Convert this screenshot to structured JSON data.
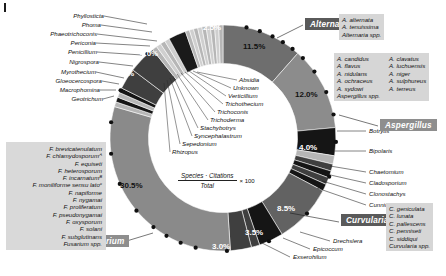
{
  "figure": {
    "corner_mark": "|",
    "formula_numerator": "Species · Citations",
    "formula_denominator": "Total",
    "formula_multiplier": "× 100"
  },
  "chart_data": {
    "type": "pie",
    "title": "",
    "subtitle": "",
    "xlabel": "",
    "ylabel": "",
    "legend_position": "callouts",
    "donut": true,
    "inner_radius_ratio": 0.66,
    "start_angle_deg": -90,
    "direction": "clockwise",
    "value_unit": "%",
    "categories": [
      "Alternaria",
      "Aspergillus",
      "Bipolaris",
      "Botrytis",
      "Chaetomium",
      "Cladosporium",
      "Clonostachys",
      "Cunninghamella",
      "Curvularia",
      "Drechslera",
      "Epicoccum",
      "Exserohilum",
      "Fusarium",
      "Geotrichum",
      "Macrophomina",
      "Gloeocercospora",
      "Myrothecium",
      "Nigrospora",
      "Penicillium",
      "Periconia",
      "Phaeotrichoconis",
      "Phoma",
      "Phyllosticta",
      "Absidia",
      "Unknown",
      "Verticillium",
      "Trichothecium",
      "Trichoconis",
      "Trichoderma",
      "Stachybotrys",
      "Syncephalastrum",
      "Sepedonium",
      "Rhizopus"
    ],
    "values": [
      11.5,
      12.0,
      4.0,
      1.2,
      1.0,
      1.0,
      1.0,
      1.0,
      8.5,
      3.5,
      1.2,
      3.0,
      30.5,
      0.7,
      0.7,
      0.7,
      0.7,
      3.0,
      4.0,
      0.7,
      0.7,
      0.7,
      0.7,
      2.5,
      0.6,
      0.6,
      0.6,
      0.6,
      0.6,
      0.6,
      0.6,
      0.6,
      0.6
    ],
    "labeled_values": [
      {
        "label": "Alternaria",
        "value": "11.5%"
      },
      {
        "label": "Aspergillus",
        "value": "12.0%"
      },
      {
        "label": "Bipolaris",
        "value": "4.0%"
      },
      {
        "label": "Curvularia",
        "value": "8.5%"
      },
      {
        "label": "Drechslera",
        "value": "3.5%"
      },
      {
        "label": "Exserohilum",
        "value": "3.0%"
      },
      {
        "label": "Fusarium",
        "value": "30.5%"
      },
      {
        "label": "Nigrospora",
        "value": "3.0%"
      },
      {
        "label": "Penicillium",
        "value": "4.0%"
      },
      {
        "label": "Absidia",
        "value": "2.5%"
      }
    ],
    "slice_percent_labels": {
      "alternaria": "11.5%",
      "aspergillus": "12.0%",
      "bipolaris": "4.0%",
      "curvularia": "8.5%",
      "drechslera": "3.5%",
      "exserohilum": "3.0%",
      "fusarium": "30.5%",
      "nigrospora": "3.0%",
      "penicillium": "4.0%",
      "absidia": "2.5%"
    },
    "colors": {
      "alternaria": "#6e6e6e",
      "aspergillus": "#8c8c8c",
      "bipolaris": "#9a9a9a",
      "dark": "#151515",
      "mid_dark": "#3f3f3f",
      "fusarium": "#8a8a8a",
      "curvularia": "#626262",
      "light": "#b6b6b6",
      "stripe": "#cfcfcf",
      "absidia": "#1a1a1a"
    }
  },
  "callouts": {
    "left": [
      "Phyllosticta",
      "Phoma",
      "Phaeotrichoconis",
      "Periconia",
      "Penicillium",
      "Nigrospora",
      "Myrothecium",
      "Gloeocercospora",
      "Macrophomina",
      "Geotrichum"
    ],
    "inner": [
      "Absidia",
      "Unknown",
      "Verticillium",
      "Trichothecium",
      "Trichoconis",
      "Trichoderma",
      "Stachybotrys",
      "Syncephalastrum",
      "Sepedonium",
      "Rhizopus"
    ],
    "right": [
      "Botrytis",
      "Bipolaris",
      "Chaetomium",
      "Cladosporium",
      "Clonostachys",
      "Cunninghamella"
    ],
    "bottom_right": [
      "Drechslera",
      "Epicoccum",
      "Exserohilum"
    ]
  },
  "genus_tags": {
    "alternaria": "Alternaria",
    "aspergillus": "Aspergillus",
    "curvularia": "Curvularia",
    "fusarium": "Fusarium"
  },
  "species_lists": {
    "alternaria": [
      "A. alternata",
      "A. tenuissima",
      "Alternaria spp."
    ],
    "aspergillus_col1": [
      "A. candidus",
      "A. flavus",
      "A. nidulans",
      "A. ochraceus",
      "A. sydowi",
      "Aspergillus spp."
    ],
    "aspergillus_col2": [
      "A. clavatus",
      "A. luchuensis",
      "A. niger",
      "A. sulphureus",
      "A. terreus"
    ],
    "curvularia": [
      "C. geniculata",
      "C. lunata",
      "C. pallescens",
      "C. penniseti",
      "C. siddiqui",
      "Curvularia spp."
    ],
    "fusarium": [
      "F. brevicatenulatum",
      "F. chlamydosporumᴬ",
      "F. equiseti",
      "F. heterosporum",
      "F. incarnatumᴮ",
      "F. moniliforme sensu latoᶜ",
      "F. napiforme",
      "F. nygamai",
      "F. proliferatum",
      "F. pseudonygamai",
      "F. oxysporum",
      "F. solani",
      "F. subglutinans",
      "Fusarium spp."
    ]
  }
}
